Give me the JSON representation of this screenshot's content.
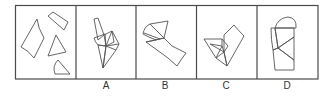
{
  "puzzle": {
    "type": "shape-composition",
    "question_panel": {
      "pieces": [
        "kite",
        "parallelogram",
        "triangle",
        "circular-sector"
      ]
    },
    "options": [
      {
        "label": "A"
      },
      {
        "label": "B"
      },
      {
        "label": "C"
      },
      {
        "label": "D"
      }
    ]
  },
  "colors": {
    "line": "#555555",
    "frame": "#4a4a4a",
    "background": "#ffffff",
    "label": "#333333"
  }
}
